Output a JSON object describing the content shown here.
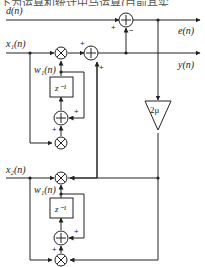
{
  "caption": "下为运算和统计中马运算(目前其实",
  "signals": {
    "desired": "d(n)",
    "error": "e(n)",
    "output": "y(n)",
    "input1": "x₁(n)",
    "weight1": "w₁(n)",
    "input2": "x₂(n)",
    "weight2": "w₁(n)"
  },
  "blocks": {
    "delay1": "z⁻¹",
    "delay2": "z⁻¹",
    "gain": "2μ"
  },
  "signs": {
    "plus": "+",
    "minus": "−"
  }
}
